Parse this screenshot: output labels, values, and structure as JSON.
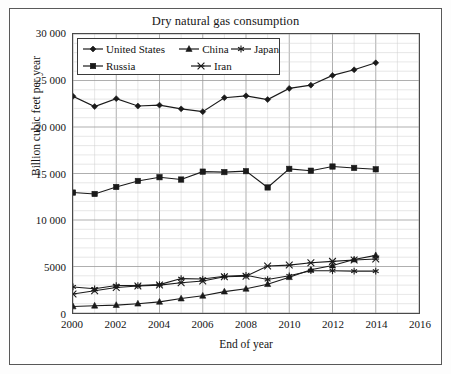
{
  "chart_data": {
    "type": "line",
    "title": "Dry natural gas consumption",
    "xlabel": "End of year",
    "ylabel": "Billion cubic feet per year",
    "x": [
      2000,
      2001,
      2002,
      2003,
      2004,
      2005,
      2006,
      2007,
      2008,
      2009,
      2010,
      2011,
      2012,
      2013,
      2014
    ],
    "xlim": [
      2000,
      2016
    ],
    "ylim": [
      0,
      30000
    ],
    "xticks": [
      "2000",
      "2002",
      "2004",
      "2006",
      "2008",
      "2010",
      "2012",
      "2014",
      "2016"
    ],
    "xtick_values": [
      2000,
      2002,
      2004,
      2006,
      2008,
      2010,
      2012,
      2014,
      2016
    ],
    "yticks": [
      "0",
      "5000",
      "10 000",
      "15 000",
      "20 000",
      "25 000",
      "30 000"
    ],
    "ytick_values": [
      0,
      5000,
      10000,
      15000,
      20000,
      25000,
      30000
    ],
    "grid": true,
    "minor_grid": true,
    "x_minor_step": 1,
    "y_minor_step": 1000,
    "legend_position": "top-left-inside",
    "series": [
      {
        "name": "United States",
        "marker": "diamond",
        "color": "#1a1a1a",
        "values": [
          23300,
          22200,
          23050,
          22250,
          22350,
          21950,
          21650,
          23150,
          23350,
          22950,
          24150,
          24500,
          25550,
          26150,
          26900
        ]
      },
      {
        "name": "China",
        "marker": "triangle",
        "color": "#1a1a1a",
        "values": [
          700,
          780,
          850,
          1000,
          1200,
          1550,
          1850,
          2300,
          2600,
          3100,
          3850,
          4650,
          5100,
          5750,
          6200
        ]
      },
      {
        "name": "Japan",
        "marker": "asterisk",
        "color": "#1a1a1a",
        "values": [
          2800,
          2600,
          2950,
          2950,
          3050,
          3700,
          3650,
          3950,
          4050,
          3600,
          4000,
          4550,
          4550,
          4500,
          4500
        ]
      },
      {
        "name": "Russia",
        "marker": "square",
        "color": "#1a1a1a",
        "values": [
          12950,
          12800,
          13550,
          14200,
          14600,
          14350,
          15200,
          15150,
          15250,
          13500,
          15500,
          15300,
          15750,
          15600,
          15450
        ]
      },
      {
        "name": "Iran",
        "marker": "cross",
        "color": "#1a1a1a",
        "values": [
          2050,
          2400,
          2750,
          2900,
          3000,
          3250,
          3450,
          3900,
          3950,
          5050,
          5150,
          5400,
          5550,
          5700,
          5800
        ]
      }
    ]
  }
}
